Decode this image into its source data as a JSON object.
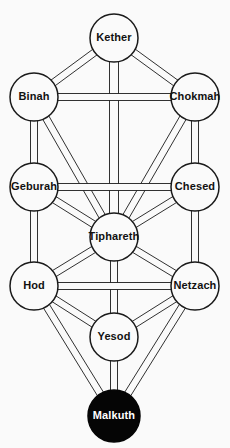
{
  "diagram": {
    "type": "node-link-diagram",
    "background_color": "#fafafa",
    "line_color": "#1a1a1a",
    "filled_node_color": "#050505",
    "filled_node_text_color": "#ffffff",
    "node_text_color": "#111111",
    "canvas": {
      "width": 230,
      "height": 448
    }
  },
  "nodes": [
    {
      "id": "kether",
      "label": "Kether",
      "cx": 114,
      "cy": 38,
      "r": 24,
      "filled": false,
      "font_size": 11
    },
    {
      "id": "binah",
      "label": "Binah",
      "cx": 34,
      "cy": 97,
      "r": 24,
      "filled": false,
      "font_size": 11
    },
    {
      "id": "chokmah",
      "label": "Chokmah",
      "cx": 195,
      "cy": 97,
      "r": 24,
      "filled": false,
      "font_size": 10
    },
    {
      "id": "geburah",
      "label": "Geburah",
      "cx": 34,
      "cy": 187,
      "r": 24,
      "filled": false,
      "font_size": 10
    },
    {
      "id": "chesed",
      "label": "Chesed",
      "cx": 195,
      "cy": 187,
      "r": 24,
      "filled": false,
      "font_size": 10
    },
    {
      "id": "tiphareth",
      "label": "Tiphareth",
      "cx": 114,
      "cy": 237,
      "r": 24,
      "filled": false,
      "font_size": 10
    },
    {
      "id": "hod",
      "label": "Hod",
      "cx": 34,
      "cy": 286,
      "r": 24,
      "filled": false,
      "font_size": 11
    },
    {
      "id": "netzach",
      "label": "Netzach",
      "cx": 195,
      "cy": 286,
      "r": 24,
      "filled": false,
      "font_size": 10
    },
    {
      "id": "yesod",
      "label": "Yesod",
      "cx": 114,
      "cy": 337,
      "r": 24,
      "filled": false,
      "font_size": 11
    },
    {
      "id": "malkuth",
      "label": "Malkuth",
      "cx": 114,
      "cy": 416,
      "r": 26,
      "filled": true,
      "font_size": 11
    }
  ],
  "edges": [
    {
      "from": "kether",
      "to": "binah",
      "width": 7
    },
    {
      "from": "kether",
      "to": "chokmah",
      "width": 7
    },
    {
      "from": "kether",
      "to": "tiphareth",
      "width": 9
    },
    {
      "from": "binah",
      "to": "chokmah",
      "width": 7
    },
    {
      "from": "binah",
      "to": "geburah",
      "width": 7
    },
    {
      "from": "binah",
      "to": "tiphareth",
      "width": 7
    },
    {
      "from": "chokmah",
      "to": "chesed",
      "width": 7
    },
    {
      "from": "chokmah",
      "to": "tiphareth",
      "width": 7
    },
    {
      "from": "geburah",
      "to": "chesed",
      "width": 7
    },
    {
      "from": "geburah",
      "to": "tiphareth",
      "width": 7
    },
    {
      "from": "geburah",
      "to": "hod",
      "width": 7
    },
    {
      "from": "chesed",
      "to": "tiphareth",
      "width": 7
    },
    {
      "from": "chesed",
      "to": "netzach",
      "width": 7
    },
    {
      "from": "tiphareth",
      "to": "hod",
      "width": 7
    },
    {
      "from": "tiphareth",
      "to": "netzach",
      "width": 7
    },
    {
      "from": "tiphareth",
      "to": "yesod",
      "width": 7
    },
    {
      "from": "hod",
      "to": "netzach",
      "width": 7
    },
    {
      "from": "hod",
      "to": "yesod",
      "width": 7
    },
    {
      "from": "hod",
      "to": "malkuth",
      "width": 7
    },
    {
      "from": "netzach",
      "to": "yesod",
      "width": 7
    },
    {
      "from": "netzach",
      "to": "malkuth",
      "width": 7
    },
    {
      "from": "yesod",
      "to": "malkuth",
      "width": 7
    }
  ]
}
